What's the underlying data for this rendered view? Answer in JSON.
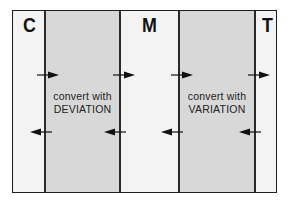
{
  "diagram": {
    "columns": [
      {
        "letter": "C"
      },
      {
        "letter": "M"
      },
      {
        "letter": "T"
      }
    ],
    "bands": [
      {
        "line1": "convert with",
        "line2": "DEVIATION"
      },
      {
        "line1": "convert with",
        "line2": "VARIATION"
      }
    ],
    "arrows": {
      "top_row_direction": "right",
      "bottom_row_direction": "left"
    },
    "colors": {
      "band_fill": "#d8d8d8",
      "background": "#f3f3f3",
      "line": "#1e1e1e"
    }
  }
}
